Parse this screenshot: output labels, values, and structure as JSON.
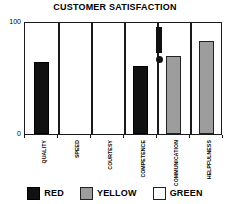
{
  "chart_data": {
    "type": "bar",
    "title": "CUSTOMER SATISFACTION",
    "xlabel": "",
    "ylabel": "",
    "ylim": [
      0,
      100
    ],
    "ytick_labels": [
      "0",
      "100"
    ],
    "grid": false,
    "legend_position": "bottom",
    "categories": [
      "QUALITY",
      "SPEED",
      "COURTESY",
      "COMPETENCE",
      "COMMUNICATION",
      "HELPFULNESS"
    ],
    "values": [
      64,
      0,
      0,
      60,
      69,
      82
    ],
    "bar_colors": [
      "red",
      "none",
      "none",
      "red",
      "yellow",
      "yellow"
    ],
    "legend": [
      {
        "label": "RED",
        "swatch": "black",
        "color": "#111111"
      },
      {
        "label": "YELLOW",
        "swatch": "gray",
        "color": "#9d9d9d"
      },
      {
        "label": "GREEN",
        "swatch": "white",
        "color": "#ffffff"
      }
    ],
    "annotations": [
      {
        "type": "exclamation-mark",
        "near_category": "COMMUNICATION",
        "symbol": "!"
      }
    ]
  },
  "axis": {
    "y_top": "100",
    "y_bottom": "0"
  }
}
